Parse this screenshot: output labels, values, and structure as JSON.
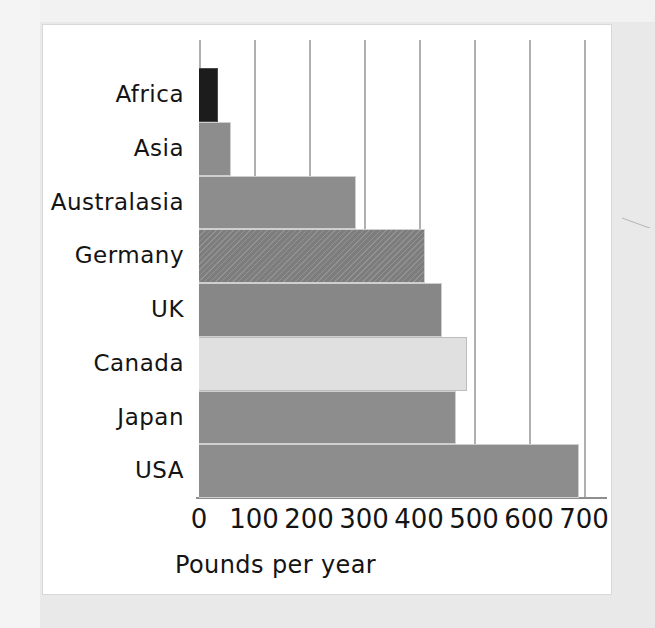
{
  "figure": {
    "background_color": "#e9e9e9",
    "card_color": "#ffffff",
    "scan_mark_name": "scan-artifact"
  },
  "chart_data": {
    "type": "bar",
    "orientation": "horizontal",
    "title": "",
    "subtitle": "",
    "xlabel": "Pounds per year",
    "ylabel": "",
    "categories": [
      "Africa",
      "Asia",
      "Australasia",
      "Germany",
      "UK",
      "Canada",
      "Japan",
      "USA"
    ],
    "values": [
      35,
      58,
      285,
      410,
      442,
      487,
      467,
      690
    ],
    "series": [
      {
        "name": "Pounds per year",
        "values": [
          35,
          58,
          285,
          410,
          442,
          487,
          467,
          690
        ]
      }
    ],
    "bar_styles": [
      "dark",
      "mid",
      "mid",
      "hatch",
      "mid2",
      "light",
      "mid",
      "mid"
    ],
    "bar_colors": [
      "#1c1c1c",
      "#8d8d8d",
      "#8d8d8d",
      "#7d7d7d",
      "#878787",
      "#e0e0e0",
      "#8d8d8d",
      "#8d8d8d"
    ],
    "xlim": [
      0,
      700
    ],
    "xticks": [
      0,
      100,
      200,
      300,
      400,
      500,
      600,
      700
    ],
    "xticklabels": [
      "0",
      "100",
      "200",
      "300",
      "400",
      "500",
      "600",
      "700"
    ],
    "grid": true,
    "grid_axis": "x",
    "grid_color": "#b0b0b0",
    "legend": false,
    "legend_position": "none",
    "axis_color": "#8e8e8e",
    "bar_edge_color": "#cfcfcf"
  }
}
